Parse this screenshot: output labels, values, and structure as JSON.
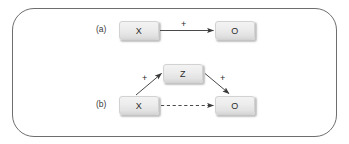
{
  "figure": {
    "background_color": "#ffffff",
    "frame_color": "#6e6e6e",
    "node_fill_color": "#ececec",
    "line_color": "#4a4a4a",
    "panels": [
      {
        "id": "a",
        "label": "(a)",
        "nodes": [
          {
            "id": "a-x",
            "label": "X"
          },
          {
            "id": "a-o",
            "label": "O"
          }
        ],
        "edges": [
          {
            "id": "a-x-to-o",
            "from": "X",
            "to": "O",
            "style": "solid",
            "sign": "+"
          }
        ]
      },
      {
        "id": "b",
        "label": "(b)",
        "nodes": [
          {
            "id": "b-x",
            "label": "X"
          },
          {
            "id": "b-z",
            "label": "Z"
          },
          {
            "id": "b-o",
            "label": "O"
          }
        ],
        "edges": [
          {
            "id": "b-x-to-z",
            "from": "X",
            "to": "Z",
            "style": "solid",
            "sign": "+"
          },
          {
            "id": "b-z-to-o",
            "from": "Z",
            "to": "O",
            "style": "solid",
            "sign": "+"
          },
          {
            "id": "b-x-to-o",
            "from": "X",
            "to": "O",
            "style": "dashed",
            "sign": ""
          }
        ]
      }
    ]
  }
}
